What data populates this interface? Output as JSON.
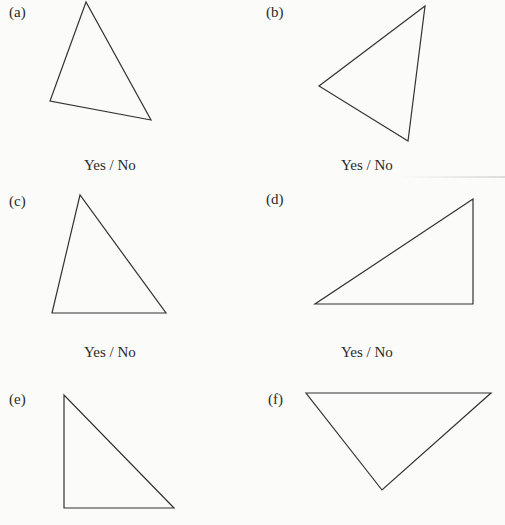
{
  "worksheet": {
    "items": [
      {
        "id": "a",
        "label": "(a)",
        "answer": "Yes / No",
        "points": "86,2 50,101 151,120"
      },
      {
        "id": "b",
        "label": "(b)",
        "answer": "Yes / No",
        "points": "425,6 319,86 408,141"
      },
      {
        "id": "c",
        "label": "(c)",
        "answer": "Yes / No",
        "points": "80,195 52,313 166,313"
      },
      {
        "id": "d",
        "label": "(d)",
        "answer": "Yes / No",
        "points": "473,199 315,304 473,304"
      },
      {
        "id": "e",
        "label": "(e)",
        "answer": "",
        "points": "64,395 64,508 174,508"
      },
      {
        "id": "f",
        "label": "(f)",
        "answer": "",
        "points": "306,393 491,393 382,490"
      }
    ]
  },
  "colors": {
    "stroke": "#333333",
    "background": "#fbfbfa"
  }
}
